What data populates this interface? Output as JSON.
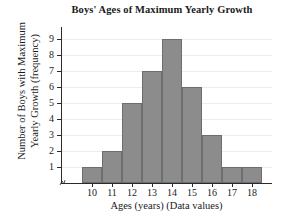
{
  "chart_data": {
    "type": "bar",
    "title": "Boys' Ages of Maximum Yearly Growth",
    "xlabel": "Ages (years) (Data values)",
    "ylabel_line1": "Number of Boys with Maximum",
    "ylabel_line2": "Yearly Growth (frequency)",
    "categories": [
      "10",
      "11",
      "12",
      "13",
      "14",
      "15",
      "16",
      "17",
      "18"
    ],
    "values": [
      1,
      2,
      5,
      7,
      9,
      6,
      3,
      1,
      1
    ],
    "yticks": [
      "1",
      "2",
      "3",
      "4",
      "5",
      "6",
      "7",
      "8",
      "9"
    ],
    "ylim": [
      0,
      9
    ],
    "xlim": [
      "9.5",
      "18.5"
    ],
    "grid": true,
    "legend": "none",
    "bar_color": "#8c8c8c",
    "bar_border_color": "#6e6e6e",
    "axis_color": "#2b2b2b",
    "grid_color": "#ededed",
    "background": "#ffffff"
  }
}
